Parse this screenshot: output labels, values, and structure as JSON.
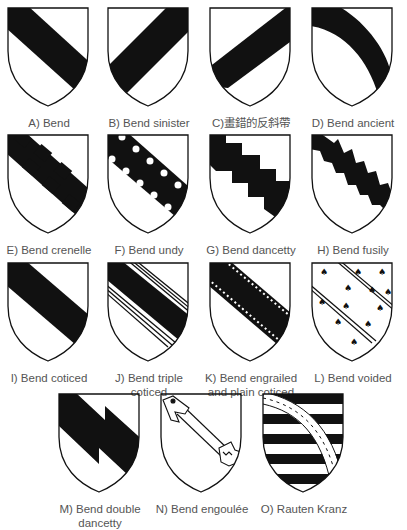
{
  "figure": {
    "items": [
      {
        "id": "A",
        "letter": "A)",
        "name": "Bend",
        "name2": ""
      },
      {
        "id": "B",
        "letter": "B)",
        "name": "Bend sinister",
        "name2": ""
      },
      {
        "id": "C",
        "letter": "C)",
        "name": "畫錯的反斜帶",
        "name2": ""
      },
      {
        "id": "D",
        "letter": "D)",
        "name": "Bend ancient",
        "name2": ""
      },
      {
        "id": "E",
        "letter": "E)",
        "name": "Bend crenelle",
        "name2": ""
      },
      {
        "id": "F",
        "letter": "F)",
        "name": "Bend undy",
        "name2": ""
      },
      {
        "id": "G",
        "letter": "G)",
        "name": "Bend dancetty",
        "name2": ""
      },
      {
        "id": "H",
        "letter": "H)",
        "name": "Bend fusily",
        "name2": ""
      },
      {
        "id": "I",
        "letter": "I)",
        "name": "Bend coticed",
        "name2": ""
      },
      {
        "id": "J",
        "letter": "J)",
        "name": "Bend triple",
        "name2": "coticed"
      },
      {
        "id": "K",
        "letter": "K)",
        "name": "Bend engrailed",
        "name2": "and plain coticed"
      },
      {
        "id": "L",
        "letter": "L)",
        "name": "Bend voided",
        "name2": ""
      },
      {
        "id": "M",
        "letter": "M)",
        "name": "Bend double",
        "name2": "dancetty"
      },
      {
        "id": "N",
        "letter": "N)",
        "name": "Bend engoulée",
        "name2": ""
      },
      {
        "id": "O",
        "letter": "O)",
        "name": "Rauten Kranz",
        "name2": ""
      }
    ],
    "colors": {
      "ink": "#111111",
      "field": "#ffffff",
      "text": "#555555"
    }
  }
}
